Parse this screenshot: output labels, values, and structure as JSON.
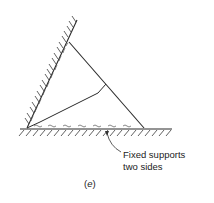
{
  "figure": {
    "caption_open": "(",
    "caption_letter": "e",
    "caption_close": ")",
    "callout": {
      "line1": "Fixed supports",
      "line2": "two sides"
    },
    "colors": {
      "line": "#2a2a2a",
      "hatch": "#3a3a3a",
      "text": "#222222"
    },
    "elements": {
      "inclined_wall": "fixed support (hatched)",
      "floor": "fixed support (hatched)",
      "triangle": "plate with interior yield line",
      "yield_line_style": "wavy",
      "edge_marks": "dashed wavy lines along supported edges"
    }
  }
}
